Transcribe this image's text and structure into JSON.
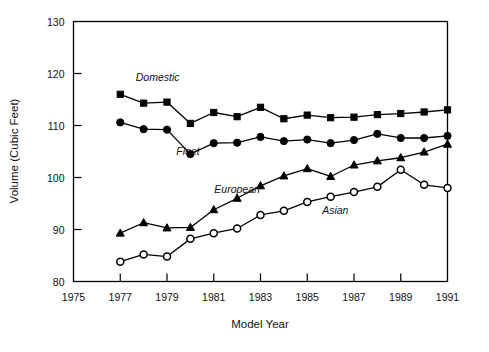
{
  "chart_data": {
    "type": "line",
    "title": "",
    "xlabel": "Model Year",
    "ylabel": "Volume (Cubic Feet)",
    "xlim": [
      1975,
      1991
    ],
    "ylim": [
      80,
      130
    ],
    "xticks": [
      1975,
      1977,
      1979,
      1981,
      1983,
      1985,
      1987,
      1989,
      1991
    ],
    "yticks": [
      80,
      90,
      100,
      110,
      120,
      130
    ],
    "grid": false,
    "legend": "inline-annotations",
    "x": [
      1977,
      1978,
      1979,
      1980,
      1981,
      1982,
      1983,
      1984,
      1985,
      1986,
      1987,
      1988,
      1989,
      1990,
      1991
    ],
    "series": [
      {
        "name": "Domestic",
        "marker": "filled-square",
        "values": [
          116.0,
          114.3,
          114.5,
          110.4,
          112.5,
          111.7,
          113.5,
          111.3,
          112.0,
          111.5,
          111.6,
          112.1,
          112.3,
          112.6,
          113.0
        ]
      },
      {
        "name": "Fleet",
        "marker": "filled-circle",
        "values": [
          110.6,
          109.3,
          109.2,
          104.5,
          106.6,
          106.7,
          107.8,
          107.0,
          107.3,
          106.6,
          107.2,
          108.4,
          107.6,
          107.6,
          108.0
        ]
      },
      {
        "name": "European",
        "marker": "filled-triangle",
        "values": [
          89.3,
          91.3,
          90.3,
          90.4,
          93.8,
          96.0,
          98.4,
          100.3,
          101.7,
          100.2,
          102.4,
          103.2,
          103.8,
          104.9,
          106.4
        ]
      },
      {
        "name": "Asian",
        "marker": "open-circle",
        "values": [
          83.8,
          85.2,
          84.8,
          88.2,
          89.3,
          90.2,
          92.8,
          93.6,
          95.3,
          96.3,
          97.2,
          98.2,
          101.5,
          98.6,
          98.0
        ]
      }
    ],
    "annotations": [
      {
        "text": "Domestic",
        "x": 1978.6,
        "y": 118.6
      },
      {
        "text": "Fleet",
        "x": 1979.9,
        "y": 104.3
      },
      {
        "text": "European",
        "x": 1982.0,
        "y": 97.0
      },
      {
        "text": "Asian",
        "x": 1986.2,
        "y": 93.0
      }
    ]
  }
}
